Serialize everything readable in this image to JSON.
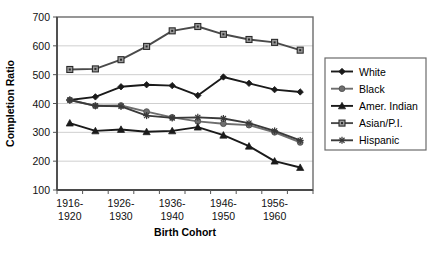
{
  "chart_data": {
    "type": "line",
    "title": "",
    "xlabel": "Birth Cohort",
    "ylabel": "Completion Ratio",
    "ylim": [
      100,
      700
    ],
    "ytick_step": 100,
    "yticks": [
      100,
      200,
      300,
      400,
      500,
      600,
      700
    ],
    "grid": true,
    "legend_position": "right",
    "x": [
      1,
      2,
      3,
      4,
      5,
      6,
      7,
      8,
      9,
      10
    ],
    "categories": [
      "1916-1920",
      "1921-1925",
      "1926-1930",
      "1931-1935",
      "1936-1940",
      "1941-1945",
      "1946-1950",
      "1951-1955",
      "1956-1960",
      "1961-1965"
    ],
    "xtick_labels_visible": [
      "1916-\n1920",
      "",
      "1926-\n1930",
      "",
      "1936-\n1940",
      "",
      "1946-\n1950",
      "",
      "1956-\n1960",
      ""
    ],
    "xtick_labels": [
      {
        "line1": "1916-",
        "line2": "1920",
        "index": 0
      },
      {
        "line1": "1926-",
        "line2": "1930",
        "index": 2
      },
      {
        "line1": "1936-",
        "line2": "1940",
        "index": 4
      },
      {
        "line1": "1946-",
        "line2": "1950",
        "index": 6
      },
      {
        "line1": "1956-",
        "line2": "1960",
        "index": 8
      }
    ],
    "series": [
      {
        "name": "White",
        "marker": "diamond",
        "color": "#1a1a1a",
        "values": [
          412,
          423,
          458,
          465,
          462,
          428,
          492,
          470,
          448,
          440
        ]
      },
      {
        "name": "Black",
        "marker": "circle",
        "color": "#6e6e6e",
        "values": [
          412,
          392,
          393,
          372,
          352,
          338,
          330,
          325,
          300,
          265
        ]
      },
      {
        "name": "Amer. Indian",
        "marker": "triangle",
        "color": "#1a1a1a",
        "values": [
          332,
          305,
          310,
          302,
          305,
          318,
          290,
          252,
          200,
          178
        ]
      },
      {
        "name": "Asian/P.I.",
        "marker": "square",
        "color": "#4a4a4a",
        "values": [
          518,
          520,
          552,
          598,
          652,
          667,
          640,
          622,
          612,
          585
        ]
      },
      {
        "name": "Hispanic",
        "marker": "asterisk",
        "color": "#3a3a3a",
        "values": [
          412,
          392,
          390,
          358,
          350,
          352,
          348,
          332,
          305,
          272
        ]
      }
    ]
  },
  "legend": {
    "items": [
      {
        "label": "White"
      },
      {
        "label": "Black"
      },
      {
        "label": "Amer. Indian"
      },
      {
        "label": "Asian/P.I."
      },
      {
        "label": "Hispanic"
      }
    ]
  },
  "colors": {
    "plot_border": "#6b6b6b",
    "grid": "#c9c9c9",
    "axis": "#555555",
    "background": "#ffffff"
  }
}
